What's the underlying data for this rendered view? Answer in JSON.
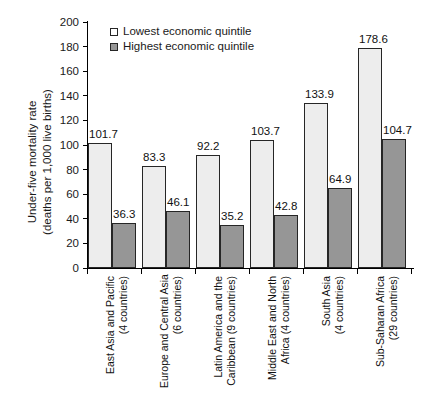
{
  "chart_data": {
    "type": "bar",
    "title": "",
    "xlabel": "",
    "ylabel": "Under-five mortality rate (deaths per 1,000 live births)",
    "ylabel_lines": [
      "Under-five mortality rate",
      "(deaths per 1,000 live births)"
    ],
    "ylim": [
      0,
      200
    ],
    "ytick_step": 20,
    "yticks": [
      0,
      20,
      40,
      60,
      80,
      100,
      120,
      140,
      160,
      180,
      200
    ],
    "ytick_labels": [
      "0",
      "20",
      "40",
      "60",
      "80",
      "100",
      "120",
      "140",
      "160",
      "180",
      "200"
    ],
    "grid": false,
    "legend_position": "top-left-inside",
    "categories": [
      "East Asia and Pacific (4 countries)",
      "Europe and Central Asia (6 countries)",
      "Latin America and the Caribbean (9 countries)",
      "Middle East and North Africa (4 countries)",
      "South Asia (4 countries)",
      "Sub-Saharan Africa (29 countries)"
    ],
    "category_lines": [
      [
        "East Asia and Pacific",
        "(4 countries)"
      ],
      [
        "Europe and Central Asia",
        "(6 countries)"
      ],
      [
        "Latin America and the",
        "Caribbean (9 countries)"
      ],
      [
        "Middle East and North",
        "Africa (4 countries)"
      ],
      [
        "South Asia",
        "(4 countries)"
      ],
      [
        "Sub-Saharan Africa",
        "(29 countries)"
      ]
    ],
    "series": [
      {
        "name": "Lowest economic quintile",
        "color": "#ededed",
        "values": [
          101.7,
          83.3,
          92.2,
          103.7,
          133.9,
          178.6
        ],
        "value_labels": [
          "101.7",
          "83.3",
          "92.2",
          "103.7",
          "133.9",
          "178.6"
        ]
      },
      {
        "name": "Highest economic quintile",
        "color": "#969696",
        "values": [
          36.3,
          46.1,
          35.2,
          42.8,
          64.9,
          104.7
        ],
        "value_labels": [
          "36.3",
          "46.1",
          "35.2",
          "42.8",
          "64.9",
          "104.7"
        ]
      }
    ]
  },
  "colors": {
    "axis": "#000000",
    "text": "#111111",
    "series_low": "#ededed",
    "series_high": "#969696",
    "bar_border": "#262626",
    "background": "#ffffff"
  }
}
